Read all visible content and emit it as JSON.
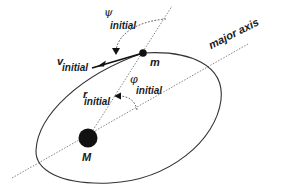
{
  "diagram": {
    "type": "orbital-geometry",
    "bodies": {
      "central": {
        "label": "M"
      },
      "orbiting": {
        "label": "m"
      }
    },
    "vectors": {
      "velocity": {
        "symbol": "v",
        "subscript": "initial"
      },
      "radius": {
        "symbol": "r",
        "subscript": "initial"
      }
    },
    "angles": {
      "psi": {
        "symbol": "ψ",
        "subscript": "initial"
      },
      "phi": {
        "symbol": "φ",
        "subscript": "initial"
      }
    },
    "axis": {
      "label": "major axis"
    },
    "colors": {
      "stroke": "#333333",
      "dotted": "#777777",
      "fill": "#111111"
    }
  }
}
